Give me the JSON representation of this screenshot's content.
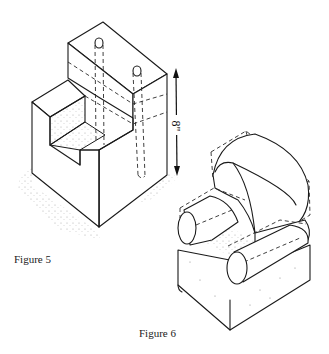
{
  "figures": [
    {
      "id": "figure-5",
      "caption": "Figure 5",
      "description": "Isometric stepped block with two vertical dashed dowel holes",
      "dimension_label": "8\""
    },
    {
      "id": "figure-6",
      "caption": "Figure 6",
      "description": "Isometric armchair built from cylinders and blocks with dashed construction box lines"
    }
  ],
  "colors": {
    "ink": "#1a1a1a",
    "paper": "#ffffff",
    "stipple": "#9a9a9a"
  }
}
